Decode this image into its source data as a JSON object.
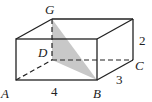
{
  "figure": {
    "type": "rectangular-prism",
    "shading_color": "#c8c8c8",
    "line_color": "#222222",
    "vertices": {
      "A": "A",
      "B": "B",
      "C": "C",
      "D": "D",
      "G": "G"
    },
    "dimensions": {
      "length": "4",
      "width": "3",
      "height": "2"
    },
    "shaded_region": "triangle GDB"
  }
}
